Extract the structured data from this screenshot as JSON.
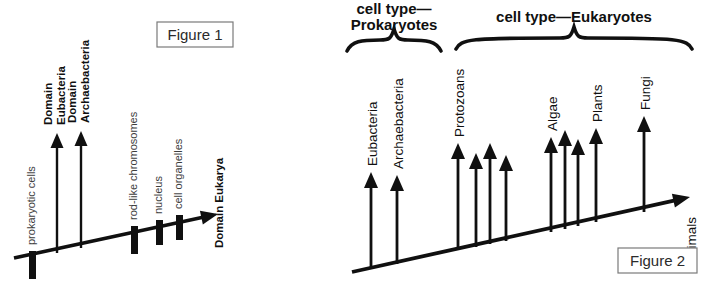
{
  "document": {
    "title": "Evolution of cell types and domains of life",
    "background_color": "#ffffff",
    "ink_color": "#101010",
    "muted_label_color": "#3d3d3d",
    "box_stroke_color": "#7a7a7a"
  },
  "figure1": {
    "caption": "Figure 1",
    "caption_box": {
      "x": 157,
      "y": 22,
      "width": 76,
      "height": 25
    },
    "axis": {
      "x1": 14,
      "y1": 258,
      "x2": 218,
      "y2": 214,
      "arrow_label": "Domain Eukarya",
      "arrow_label_bold": true
    },
    "tick_bars": [
      {
        "name": "prokaryotic cells",
        "label": "prokaryotic cells",
        "x": 29,
        "y": 251,
        "width": 7,
        "height": 28,
        "label_color": "#3d3d3d",
        "bold": false
      },
      {
        "name": "rod-like chromosomes",
        "label": "rod-like chromosomes",
        "x": 131,
        "y": 226,
        "width": 7,
        "height": 28,
        "label_color": "#3d3d3d",
        "bold": false
      },
      {
        "name": "nucleus",
        "label": "nucleus",
        "x": 156,
        "y": 220,
        "width": 7,
        "height": 25,
        "label_color": "#3d3d3d",
        "bold": false
      },
      {
        "name": "cell organelles",
        "label": "cell organelles",
        "x": 176,
        "y": 215,
        "width": 7,
        "height": 25,
        "label_color": "#3d3d3d",
        "bold": false
      }
    ],
    "branch_arrows": [
      {
        "name": "Domain Eubacteria",
        "label_line1": "Domain",
        "label_line2": "Eubacteria",
        "x": 57,
        "base_y": 253,
        "tip_y": 133
      },
      {
        "name": "Domain Archaebacteria",
        "label_line1": "Domain",
        "label_line2": "Archaebacteria",
        "x": 81,
        "base_y": 248,
        "tip_y": 131
      }
    ]
  },
  "figure2": {
    "caption": "Figure 2",
    "caption_box": {
      "x": 618,
      "y": 248,
      "width": 79,
      "height": 25
    },
    "axis": {
      "x1": 352,
      "y1": 272,
      "x2": 690,
      "y2": 197,
      "arrow_label": "Animals",
      "arrow_label_bold": false
    },
    "braces": [
      {
        "name": "prokaryotes-brace",
        "title_line1": "cell type—",
        "title_line2": "Prokaryotes",
        "x_start": 347,
        "x_end": 441,
        "y": 40,
        "depth": 11,
        "title_x": 394,
        "title_y1": 14,
        "title_y2": 30
      },
      {
        "name": "eukaryotes-brace",
        "title_line1": "cell type—Eukaryotes",
        "title_line2": "",
        "x_start": 456,
        "x_end": 692,
        "y": 38,
        "depth": 11,
        "title_x": 574,
        "title_y1": 22,
        "title_y2": 0
      }
    ],
    "arrows": [
      {
        "name": "Eubacteria",
        "label": "Eubacteria",
        "x": 371,
        "base_y": 269,
        "tip_y": 172,
        "labeled": true
      },
      {
        "name": "Archaebacteria",
        "label": "Archaebacteria",
        "x": 397,
        "base_y": 264,
        "tip_y": 175,
        "labeled": true
      },
      {
        "name": "Protozoans",
        "label": "Protozoans",
        "x": 458,
        "base_y": 250,
        "tip_y": 143,
        "labeled": true
      },
      {
        "name": "protozoan-branch-2",
        "label": "",
        "x": 476,
        "base_y": 247,
        "tip_y": 153,
        "labeled": false
      },
      {
        "name": "protozoan-branch-3",
        "label": "",
        "x": 490,
        "base_y": 244,
        "tip_y": 143,
        "labeled": false
      },
      {
        "name": "protozoan-branch-4",
        "label": "",
        "x": 506,
        "base_y": 241,
        "tip_y": 155,
        "labeled": false
      },
      {
        "name": "Algae",
        "label": "Algae",
        "x": 551,
        "base_y": 232,
        "tip_y": 137,
        "labeled": true
      },
      {
        "name": "algae-branch-2",
        "label": "",
        "x": 565,
        "base_y": 229,
        "tip_y": 130,
        "labeled": false
      },
      {
        "name": "algae-branch-3",
        "label": "",
        "x": 578,
        "base_y": 226,
        "tip_y": 139,
        "labeled": false
      },
      {
        "name": "Plants",
        "label": "Plants",
        "x": 596,
        "base_y": 222,
        "tip_y": 128,
        "labeled": true
      },
      {
        "name": "Fungi",
        "label": "Fungi",
        "x": 644,
        "base_y": 212,
        "tip_y": 116,
        "labeled": true
      }
    ]
  }
}
